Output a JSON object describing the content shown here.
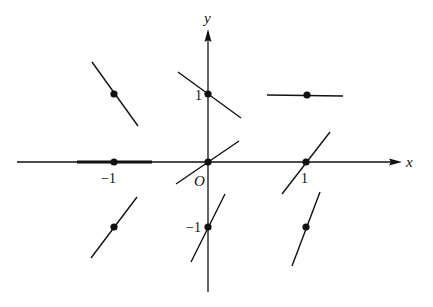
{
  "diagram": {
    "type": "slope-field",
    "axes": {
      "x_label": "x",
      "y_label": "y",
      "origin_label": "O",
      "tick_labels": {
        "x_neg1": "−1",
        "x_pos1": "1",
        "y_pos1": "1",
        "y_neg1": "−1"
      }
    },
    "points": [
      {
        "x": -1,
        "y": 1,
        "slope_direction": "negative-steep"
      },
      {
        "x": 0,
        "y": 1,
        "slope_direction": "negative-shallow"
      },
      {
        "x": 1,
        "y": 1,
        "slope_direction": "zero"
      },
      {
        "x": -1,
        "y": 0,
        "slope_direction": "zero"
      },
      {
        "x": 0,
        "y": 0,
        "slope_direction": "positive-shallow"
      },
      {
        "x": 1,
        "y": 0,
        "slope_direction": "positive"
      },
      {
        "x": -1,
        "y": -1,
        "slope_direction": "positive"
      },
      {
        "x": 0,
        "y": -1,
        "slope_direction": "positive-steep"
      },
      {
        "x": 1,
        "y": -1,
        "slope_direction": "positive-steep"
      }
    ],
    "colors": {
      "ink": "#111111",
      "background": "#ffffff"
    }
  }
}
